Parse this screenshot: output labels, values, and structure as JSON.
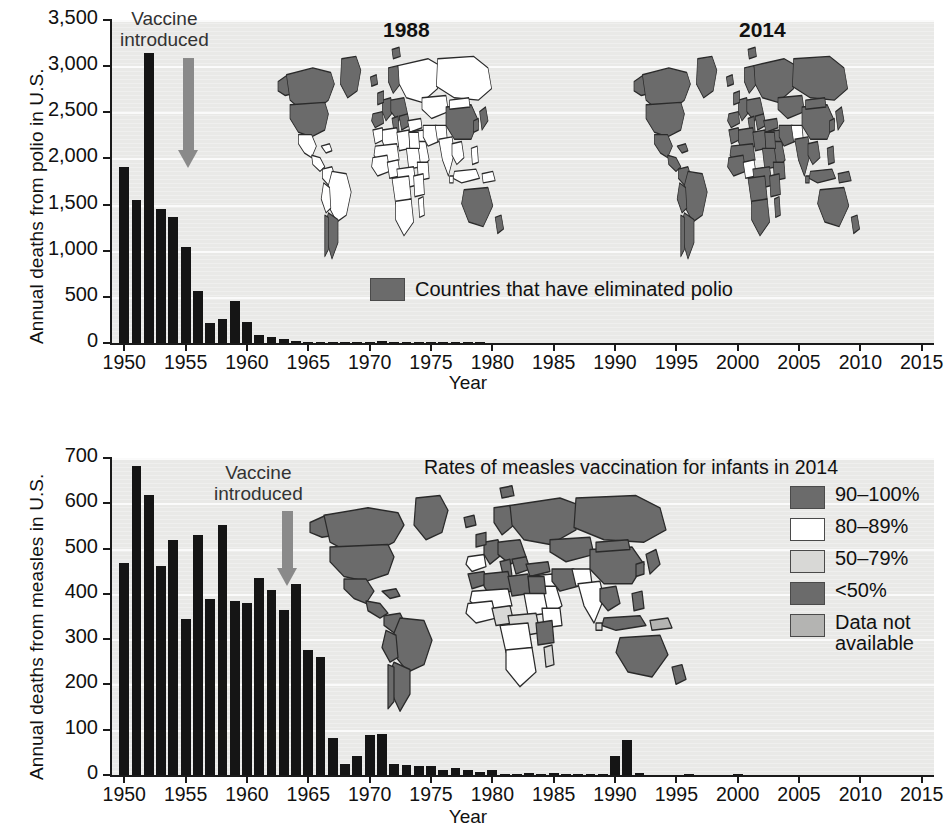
{
  "colors": {
    "plot_background": "#e9e9e7",
    "bar": "#151515",
    "arrow": "#8a8a8a",
    "map_dark": "#6b6b6b",
    "map_white": "#ffffff",
    "map_light": "#d8d8d6",
    "map_mid": "#b4b4b2",
    "map_outline": "#2a2a2a",
    "axis": "#1a1a1a",
    "gridline": "#fbfbfb"
  },
  "polio": {
    "ylabel": "Annual deaths from polio in U.S.",
    "xlabel": "Year",
    "annotation": {
      "line1": "Vaccine",
      "line2": "introduced",
      "year": 1955
    },
    "map_left_title": "1988",
    "map_right_title": "2014",
    "legend": {
      "swatch": "map_dark",
      "label": "Countries that have eliminated polio"
    },
    "chart_data": {
      "type": "bar",
      "title": "",
      "xlabel": "Year",
      "ylabel": "Annual deaths from polio in U.S.",
      "xlim": [
        1949,
        2016
      ],
      "ylim": [
        0,
        3500
      ],
      "yticks": [
        "0",
        "500",
        "1,000",
        "1,500",
        "2,000",
        "2,500",
        "3,000",
        "3,500"
      ],
      "ytick_values": [
        0,
        500,
        1000,
        1500,
        2000,
        2500,
        3000,
        3500
      ],
      "xticks": [
        1950,
        1955,
        1960,
        1965,
        1970,
        1975,
        1980,
        1985,
        1990,
        1995,
        2000,
        2005,
        2010,
        2015
      ],
      "grid": true,
      "legend_position": "inside-bottom-center",
      "x": [
        1950,
        1951,
        1952,
        1953,
        1954,
        1955,
        1956,
        1957,
        1958,
        1959,
        1960,
        1961,
        1962,
        1963,
        1964,
        1965,
        1966,
        1967,
        1968,
        1969,
        1970,
        1971,
        1972,
        1973,
        1974,
        1975,
        1976,
        1977,
        1978,
        1979,
        1980,
        1981,
        1982,
        1983,
        1984,
        1985,
        1986,
        1987,
        1988,
        1989,
        1990,
        1991,
        1992,
        1993,
        1994,
        1995,
        1996,
        1997,
        1998,
        1999,
        2000,
        2001,
        2002,
        2003,
        2004,
        2005,
        2006,
        2007,
        2008,
        2009,
        2010,
        2011,
        2012,
        2013,
        2014,
        2015
      ],
      "values": [
        1904,
        1551,
        3145,
        1450,
        1368,
        1043,
        566,
        221,
        255,
        454,
        230,
        90,
        60,
        41,
        17,
        16,
        9,
        11,
        6,
        13,
        7,
        18,
        2,
        2,
        1,
        2,
        1,
        1,
        1,
        1,
        0,
        0,
        0,
        0,
        0,
        0,
        0,
        0,
        0,
        0,
        0,
        0,
        0,
        0,
        0,
        0,
        0,
        0,
        0,
        0,
        0,
        0,
        0,
        0,
        0,
        0,
        0,
        0,
        0,
        0,
        0,
        0,
        0,
        0,
        0,
        0
      ]
    }
  },
  "measles": {
    "ylabel": "Annual deaths from measles in U.S.",
    "xlabel": "Year",
    "annotation": {
      "line1": "Vaccine",
      "line2": "introduced",
      "year": 1963
    },
    "legend_title": "Rates of measles vaccination for infants in 2014",
    "legend": [
      {
        "swatch": "map_dark",
        "label": "90–100%"
      },
      {
        "swatch": "map_white",
        "label": "80–89%"
      },
      {
        "swatch": "map_light",
        "label": "50–79%"
      },
      {
        "swatch": "map_dark",
        "label": "<50%"
      },
      {
        "swatch": "map_mid",
        "label": "Data not\navailable"
      }
    ],
    "chart_data": {
      "type": "bar",
      "title": "",
      "xlabel": "Year",
      "ylabel": "Annual deaths from measles in U.S.",
      "xlim": [
        1949,
        2016
      ],
      "ylim": [
        0,
        700
      ],
      "yticks": [
        "0",
        "100",
        "200",
        "300",
        "400",
        "500",
        "600",
        "700"
      ],
      "ytick_values": [
        0,
        100,
        200,
        300,
        400,
        500,
        600,
        700
      ],
      "xticks": [
        1950,
        1955,
        1960,
        1965,
        1970,
        1975,
        1980,
        1985,
        1990,
        1995,
        2000,
        2005,
        2010,
        2015
      ],
      "grid": true,
      "legend_position": "top-right",
      "x": [
        1950,
        1951,
        1952,
        1953,
        1954,
        1955,
        1956,
        1957,
        1958,
        1959,
        1960,
        1961,
        1962,
        1963,
        1964,
        1965,
        1966,
        1967,
        1968,
        1969,
        1970,
        1971,
        1972,
        1973,
        1974,
        1975,
        1976,
        1977,
        1978,
        1979,
        1980,
        1981,
        1982,
        1983,
        1984,
        1985,
        1986,
        1987,
        1988,
        1989,
        1990,
        1991,
        1992,
        1993,
        1994,
        1995,
        1996,
        1997,
        1998,
        1999,
        2000,
        2001,
        2002,
        2003,
        2004,
        2005,
        2006,
        2007,
        2008,
        2009,
        2010,
        2011,
        2012,
        2013,
        2014,
        2015
      ],
      "values": [
        468,
        683,
        618,
        462,
        518,
        345,
        530,
        389,
        552,
        385,
        380,
        434,
        408,
        364,
        421,
        276,
        261,
        81,
        24,
        41,
        89,
        90,
        24,
        23,
        20,
        20,
        12,
        15,
        11,
        6,
        11,
        2,
        2,
        4,
        1,
        4,
        2,
        2,
        3,
        1,
        41,
        77,
        4,
        0,
        0,
        0,
        1,
        0,
        0,
        0,
        1,
        0,
        0,
        0,
        0,
        0,
        0,
        0,
        0,
        0,
        0,
        0,
        0,
        0,
        0,
        0
      ]
    }
  }
}
